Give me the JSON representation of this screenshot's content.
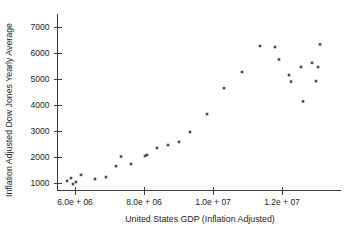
{
  "chart_data": {
    "type": "scatter",
    "title": "",
    "xlabel": "United States GDP (Inflation Adjusted)",
    "ylabel": "Inflation Adjusted Dow Jones Yearly Average",
    "xlim": [
      5500000,
      13100000
    ],
    "ylim": [
      700,
      7300
    ],
    "grid": false,
    "legend": null,
    "xticks": [
      6000000,
      8000000,
      10000000,
      12000000
    ],
    "xticklabels": [
      "6.0e + 06",
      "8.0e + 06",
      "1.0e + 07",
      "1.2e + 07"
    ],
    "yticks": [
      1000,
      2000,
      3000,
      4000,
      5000,
      6000,
      7000
    ],
    "yticklabels": [
      "1000",
      "2000",
      "3000",
      "4000",
      "5000",
      "6000",
      "7000"
    ],
    "marker": "filled-square",
    "marker_color": "#4a4a52",
    "series": [
      {
        "name": "Dow Jones vs GDP",
        "points": [
          [
            5768000,
            1080
          ],
          [
            5884000,
            1190
          ],
          [
            5942000,
            960
          ],
          [
            6029000,
            1040
          ],
          [
            6174000,
            1310
          ],
          [
            6580000,
            1150
          ],
          [
            6899000,
            1230
          ],
          [
            7189000,
            1650
          ],
          [
            7333000,
            2020
          ],
          [
            7623000,
            1730
          ],
          [
            8029000,
            2040
          ],
          [
            8087000,
            2080
          ],
          [
            8377000,
            2350
          ],
          [
            8696000,
            2460
          ],
          [
            9015000,
            2580
          ],
          [
            9333000,
            2960
          ],
          [
            9826000,
            3650
          ],
          [
            10319000,
            4650
          ],
          [
            10841000,
            5270
          ],
          [
            11362000,
            6270
          ],
          [
            11797000,
            6230
          ],
          [
            11913000,
            5750
          ],
          [
            12203000,
            5150
          ],
          [
            12261000,
            4900
          ],
          [
            12551000,
            5460
          ],
          [
            12609000,
            4140
          ],
          [
            12870000,
            5620
          ],
          [
            13044000,
            5460
          ],
          [
            13102000,
            6330
          ],
          [
            12986000,
            4920
          ]
        ]
      }
    ]
  },
  "axes": {
    "x_axis_name": "x-axis",
    "y_axis_name": "y-axis"
  }
}
